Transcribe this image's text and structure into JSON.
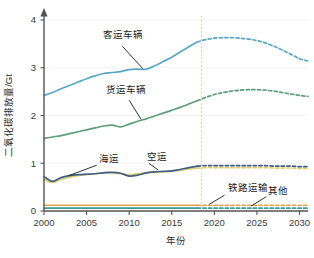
{
  "chart_data": {
    "type": "line",
    "title": "",
    "xlabel": "年份",
    "ylabel": "二氧化碳排放量/Gt",
    "xlim": [
      2000,
      2031
    ],
    "ylim": [
      0,
      4
    ],
    "yticks": [
      0,
      1,
      2,
      3,
      4
    ],
    "ytick_labels": [
      "0",
      "1",
      "2",
      "3",
      "4"
    ],
    "xticks": [
      2000,
      2005,
      2010,
      2015,
      2020,
      2025,
      2030
    ],
    "xtick_labels": [
      "2000",
      "2005",
      "2010",
      "2015",
      "2020",
      "2025",
      "2030"
    ],
    "grid": "light-horizontal",
    "legend": "inline-annotations",
    "projection_divider_year": 2018.5,
    "historical_range": [
      2000,
      2018
    ],
    "projection_range": [
      2018,
      2031
    ],
    "series": [
      {
        "name": "客运车辆",
        "color": "#5aa7c8",
        "label": "客运车辆",
        "label_x": 2009.3,
        "label_y": 3.62,
        "x": [
          2000,
          2001,
          2002,
          2003,
          2004,
          2005,
          2006,
          2007,
          2008,
          2009,
          2010,
          2011,
          2012,
          2013,
          2014,
          2015,
          2016,
          2017,
          2018,
          2019,
          2020,
          2021,
          2022,
          2023,
          2024,
          2025,
          2026,
          2027,
          2028,
          2029,
          2030,
          2031
        ],
        "values": [
          2.42,
          2.48,
          2.56,
          2.63,
          2.7,
          2.77,
          2.83,
          2.88,
          2.9,
          2.92,
          2.96,
          2.97,
          2.97,
          3.04,
          3.13,
          3.22,
          3.33,
          3.44,
          3.54,
          3.59,
          3.62,
          3.63,
          3.63,
          3.62,
          3.6,
          3.57,
          3.52,
          3.45,
          3.37,
          3.28,
          3.19,
          3.14
        ]
      },
      {
        "name": "货运车辆",
        "color": "#5e9e79",
        "label": "货运车辆",
        "label_x": 2009.6,
        "label_y": 2.48,
        "x": [
          2000,
          2001,
          2002,
          2003,
          2004,
          2005,
          2006,
          2007,
          2008,
          2009,
          2010,
          2011,
          2012,
          2013,
          2014,
          2015,
          2016,
          2017,
          2018,
          2019,
          2020,
          2021,
          2022,
          2023,
          2024,
          2025,
          2026,
          2027,
          2028,
          2029,
          2030,
          2031
        ],
        "values": [
          1.52,
          1.55,
          1.58,
          1.62,
          1.66,
          1.7,
          1.74,
          1.78,
          1.8,
          1.76,
          1.82,
          1.88,
          1.93,
          1.99,
          2.05,
          2.11,
          2.17,
          2.24,
          2.31,
          2.38,
          2.44,
          2.48,
          2.51,
          2.53,
          2.54,
          2.54,
          2.53,
          2.51,
          2.48,
          2.45,
          2.42,
          2.4
        ]
      },
      {
        "name": "海运",
        "color": "#3f5e8c",
        "label": "海运",
        "label_x": 2006.4,
        "label_y": 1.02,
        "x": [
          2000,
          2001,
          2002,
          2003,
          2004,
          2005,
          2006,
          2007,
          2008,
          2009,
          2010,
          2011,
          2012,
          2013,
          2014,
          2015,
          2016,
          2017,
          2018,
          2019,
          2020,
          2021,
          2022,
          2023,
          2024,
          2025,
          2026,
          2027,
          2028,
          2029,
          2030,
          2031
        ],
        "values": [
          0.72,
          0.62,
          0.7,
          0.74,
          0.76,
          0.77,
          0.78,
          0.8,
          0.81,
          0.79,
          0.73,
          0.75,
          0.8,
          0.82,
          0.83,
          0.84,
          0.87,
          0.91,
          0.94,
          0.95,
          0.95,
          0.95,
          0.95,
          0.95,
          0.95,
          0.95,
          0.95,
          0.94,
          0.94,
          0.94,
          0.93,
          0.93
        ]
      },
      {
        "name": "空运",
        "color": "#e3cf6a",
        "label": "空运",
        "label_x": 2012.1,
        "label_y": 1.06,
        "x": [
          2000,
          2001,
          2002,
          2003,
          2004,
          2005,
          2006,
          2007,
          2008,
          2009,
          2010,
          2011,
          2012,
          2013,
          2014,
          2015,
          2016,
          2017,
          2018,
          2019,
          2020,
          2021,
          2022,
          2023,
          2024,
          2025,
          2026,
          2027,
          2028,
          2029,
          2030,
          2031
        ],
        "values": [
          0.66,
          0.6,
          0.66,
          0.71,
          0.74,
          0.76,
          0.78,
          0.8,
          0.8,
          0.78,
          0.76,
          0.78,
          0.8,
          0.81,
          0.82,
          0.83,
          0.85,
          0.88,
          0.9,
          0.91,
          0.91,
          0.91,
          0.91,
          0.91,
          0.91,
          0.91,
          0.91,
          0.9,
          0.9,
          0.9,
          0.89,
          0.89
        ]
      },
      {
        "name": "铁路运输",
        "color": "#e8a24a",
        "label": "铁路运输",
        "label_x": 2021.6,
        "label_y": 0.42,
        "x": [
          2000,
          2001,
          2002,
          2003,
          2004,
          2005,
          2006,
          2007,
          2008,
          2009,
          2010,
          2011,
          2012,
          2013,
          2014,
          2015,
          2016,
          2017,
          2018,
          2019,
          2020,
          2021,
          2022,
          2023,
          2024,
          2025,
          2026,
          2027,
          2028,
          2029,
          2030,
          2031
        ],
        "values": [
          0.12,
          0.12,
          0.12,
          0.12,
          0.12,
          0.12,
          0.12,
          0.12,
          0.12,
          0.12,
          0.12,
          0.12,
          0.12,
          0.12,
          0.12,
          0.12,
          0.12,
          0.12,
          0.12,
          0.12,
          0.12,
          0.12,
          0.12,
          0.12,
          0.12,
          0.12,
          0.12,
          0.12,
          0.12,
          0.12,
          0.12,
          0.12
        ]
      },
      {
        "name": "其他",
        "color": "#3f9a96",
        "label": "其他",
        "label_x": 2026.3,
        "label_y": 0.36,
        "x": [
          2000,
          2001,
          2002,
          2003,
          2004,
          2005,
          2006,
          2007,
          2008,
          2009,
          2010,
          2011,
          2012,
          2013,
          2014,
          2015,
          2016,
          2017,
          2018,
          2019,
          2020,
          2021,
          2022,
          2023,
          2024,
          2025,
          2026,
          2027,
          2028,
          2029,
          2030,
          2031
        ],
        "values": [
          0.06,
          0.06,
          0.06,
          0.06,
          0.06,
          0.06,
          0.06,
          0.06,
          0.06,
          0.06,
          0.06,
          0.06,
          0.06,
          0.06,
          0.06,
          0.06,
          0.06,
          0.06,
          0.06,
          0.06,
          0.06,
          0.06,
          0.06,
          0.06,
          0.06,
          0.06,
          0.06,
          0.06,
          0.06,
          0.06,
          0.06,
          0.06
        ]
      }
    ],
    "annotations": [
      {
        "name": "客运车辆",
        "from_x": 2009.2,
        "from_y": 3.45,
        "to_x": 2011.6,
        "to_y": 2.98
      },
      {
        "name": "货运车辆",
        "from_x": 2010.0,
        "from_y": 2.32,
        "to_x": 2011.4,
        "to_y": 1.92
      },
      {
        "name": "海运",
        "from_x": 2006.2,
        "from_y": 0.96,
        "to_x": 2002.9,
        "to_y": 0.74
      },
      {
        "name": "空运",
        "from_x": 2012.3,
        "from_y": 1.0,
        "to_x": 2013.4,
        "to_y": 0.86
      },
      {
        "name": "铁路运输",
        "from_x": 2021.2,
        "from_y": 0.33,
        "to_x": 2019.4,
        "to_y": 0.14
      },
      {
        "name": "其他",
        "from_x": 2026.1,
        "from_y": 0.3,
        "to_x": 2024.3,
        "to_y": 0.1
      }
    ]
  }
}
